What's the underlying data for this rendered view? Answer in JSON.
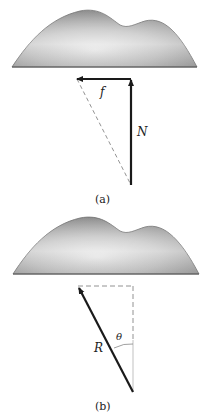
{
  "figure": {
    "panels": [
      {
        "id": "a",
        "caption": "(a)",
        "vectors": [
          {
            "name": "friction",
            "label": "f",
            "direction": "left",
            "style": "solid"
          },
          {
            "name": "normal",
            "label": "N",
            "direction": "up",
            "style": "solid"
          }
        ],
        "construction": [
          {
            "name": "resultant-diagonal",
            "style": "dashed"
          }
        ]
      },
      {
        "id": "b",
        "caption": "(b)",
        "vectors": [
          {
            "name": "resultant",
            "label": "R",
            "direction": "up-left",
            "style": "solid"
          }
        ],
        "angle": {
          "label": "θ",
          "between": "R and vertical"
        },
        "construction": [
          {
            "name": "horizontal-component",
            "style": "dashed"
          },
          {
            "name": "vertical-component",
            "style": "dashed"
          }
        ]
      }
    ],
    "colors": {
      "vector": "#1a1a1a",
      "dashed": "#777777",
      "body_dark": "#8a8a8a",
      "body_light": "#e8e8e8"
    }
  }
}
